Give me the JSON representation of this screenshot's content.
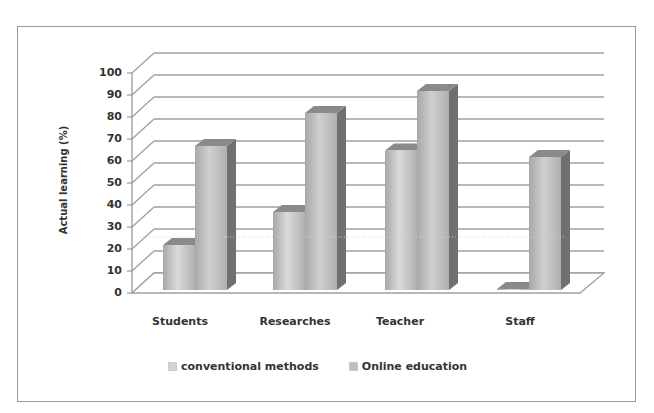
{
  "chart_data": {
    "type": "bar",
    "style": "3d-clustered-column",
    "title": "",
    "xlabel": "",
    "ylabel": "Actual learning (%)",
    "ylim": [
      0,
      100
    ],
    "yticks": [
      "0",
      "10",
      "20",
      "30",
      "40",
      "50",
      "60",
      "70",
      "80",
      "90",
      "100"
    ],
    "categories": [
      "Students",
      "Researches",
      "Teacher",
      "Staff"
    ],
    "series": [
      {
        "name": "conventional methods",
        "values": [
          25,
          40,
          68,
          5
        ],
        "color": "#c8c8c8"
      },
      {
        "name": "Online education",
        "values": [
          70,
          85,
          95,
          65
        ],
        "color": "#b4b4b4"
      }
    ],
    "grid": true,
    "legend_position": "bottom"
  },
  "colors": {
    "frame": "#9a9a9a",
    "gridline": "#a0a0a0",
    "bar_side": "#707070",
    "text": "#333333"
  }
}
